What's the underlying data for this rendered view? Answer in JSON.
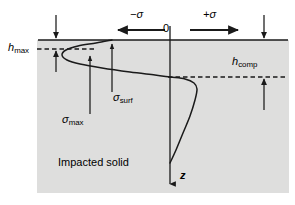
{
  "figure": {
    "background_color": "#ffffff",
    "solid_fill_color": "#dededd",
    "line_color": "#1a1a1a"
  },
  "labels": {
    "h_max": {
      "base": "h",
      "subscript": "max"
    },
    "h_comp": {
      "base": "h",
      "subscript": "comp"
    },
    "sigma_negative": "−σ",
    "sigma_positive": "+σ",
    "origin": "0",
    "depth_axis": "z",
    "sigma_surf": {
      "base": "σ",
      "subscript": "surf"
    },
    "sigma_max": {
      "base": "σ",
      "subscript": "max"
    },
    "medium": "Impacted solid"
  },
  "chart_data": {
    "type": "line",
    "xlabel": "σ",
    "ylabel": "z",
    "orientation": "depth-downward",
    "axis_directions": {
      "negative_sigma": "left",
      "positive_sigma": "right",
      "z": "downward"
    },
    "origin_px": {
      "x": 170,
      "y": 40
    },
    "surface_line_y_px": 40,
    "annotations": [
      {
        "name": "h_max",
        "text": "h_max",
        "kind": "dimension",
        "dashed_line_y_px": 49,
        "meaning": "depth of maximum tensile stress region"
      },
      {
        "name": "h_comp",
        "text": "h_comp",
        "kind": "dimension",
        "dashed_line_y_px": 77,
        "meaning": "depth at which stress becomes compressive"
      },
      {
        "name": "sigma_surf",
        "text": "σ_surf",
        "kind": "pointer",
        "target_px": {
          "x": 112,
          "y": 44
        }
      },
      {
        "name": "sigma_max",
        "text": "σ_max",
        "kind": "pointer",
        "target_px": {
          "x": 90,
          "y": 55
        }
      },
      {
        "name": "medium",
        "text": "Impacted solid",
        "kind": "region-label"
      }
    ],
    "series": [
      {
        "name": "stress profile",
        "comment": "sigma (px x, 170 = zero) versus depth (px y, 40 = surface)",
        "points_px": [
          {
            "x": 112,
            "y": 40
          },
          {
            "x": 96,
            "y": 43
          },
          {
            "x": 78,
            "y": 46
          },
          {
            "x": 66,
            "y": 50
          },
          {
            "x": 62,
            "y": 55
          },
          {
            "x": 67,
            "y": 60
          },
          {
            "x": 80,
            "y": 64
          },
          {
            "x": 102,
            "y": 68
          },
          {
            "x": 130,
            "y": 72
          },
          {
            "x": 155,
            "y": 75
          },
          {
            "x": 170,
            "y": 77
          },
          {
            "x": 185,
            "y": 79
          },
          {
            "x": 194,
            "y": 83
          },
          {
            "x": 197,
            "y": 89
          },
          {
            "x": 195,
            "y": 100
          },
          {
            "x": 190,
            "y": 116
          },
          {
            "x": 183,
            "y": 133
          },
          {
            "x": 176,
            "y": 150
          },
          {
            "x": 170,
            "y": 163
          }
        ]
      }
    ],
    "grid": false,
    "legend": null
  }
}
